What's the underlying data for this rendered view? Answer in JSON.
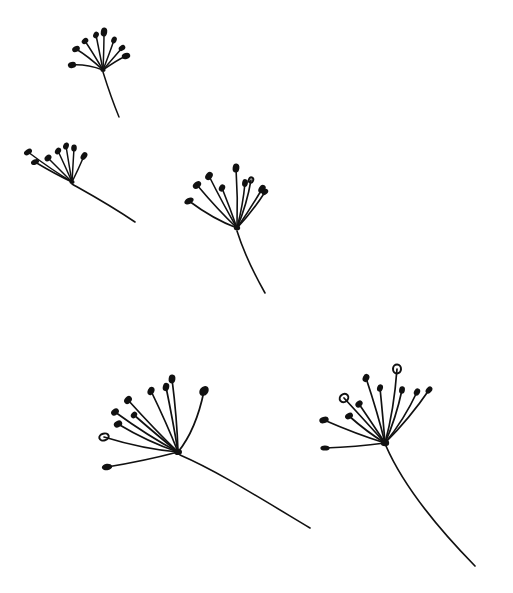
{
  "artwork": {
    "title": "Dandelion Seeds Drifting",
    "medium": "pen-and-ink line drawing",
    "background_color": "#ffffff",
    "ink_color": "#111111",
    "canvas": {
      "width": 513,
      "height": 593
    },
    "subject_count": 5,
    "description": "Five stylized dandelion seed heads (pappus) scattered across a white field, each a radiating fan of fine rays tipped with solid teardrop pods, trailing a single curved stem."
  },
  "seeds": [
    {
      "id": "seed-top-left",
      "label": "Top-left dandelion seed",
      "hub": {
        "x": 103,
        "y": 70
      },
      "hub_radius": 2.6,
      "ray_count": 8,
      "stroke_width": 1.5,
      "rays": [
        {
          "tip": {
            "x": 72,
            "y": 65
          },
          "ctrl": {
            "x": 86,
            "y": 64
          },
          "pod_rx": 4.2,
          "pod_ry": 3.0,
          "pod_rot": -12,
          "ring": false
        },
        {
          "tip": {
            "x": 76,
            "y": 49
          },
          "ctrl": {
            "x": 88,
            "y": 56
          },
          "pod_rx": 4.0,
          "pod_ry": 2.9,
          "pod_rot": -28,
          "ring": false
        },
        {
          "tip": {
            "x": 85,
            "y": 41
          },
          "ctrl": {
            "x": 93,
            "y": 53
          },
          "pod_rx": 3.6,
          "pod_ry": 2.7,
          "pod_rot": -40,
          "ring": false
        },
        {
          "tip": {
            "x": 96,
            "y": 35
          },
          "ctrl": {
            "x": 99,
            "y": 50
          },
          "pod_rx": 3.4,
          "pod_ry": 2.7,
          "pod_rot": -62,
          "ring": false
        },
        {
          "tip": {
            "x": 104,
            "y": 32
          },
          "ctrl": {
            "x": 104,
            "y": 48
          },
          "pod_rx": 4.6,
          "pod_ry": 3.2,
          "pod_rot": -82,
          "ring": false
        },
        {
          "tip": {
            "x": 114,
            "y": 40
          },
          "ctrl": {
            "x": 110,
            "y": 52
          },
          "pod_rx": 3.5,
          "pod_ry": 2.6,
          "pod_rot": -64,
          "ring": false
        },
        {
          "tip": {
            "x": 122,
            "y": 48
          },
          "ctrl": {
            "x": 115,
            "y": 56
          },
          "pod_rx": 3.6,
          "pod_ry": 2.6,
          "pod_rot": -36,
          "ring": false
        },
        {
          "tip": {
            "x": 126,
            "y": 56
          },
          "ctrl": {
            "x": 117,
            "y": 60
          },
          "pod_rx": 4.3,
          "pod_ry": 3.1,
          "pod_rot": -16,
          "ring": false
        }
      ],
      "stem": {
        "d": "M103,72 C108,88 112,100 119,117",
        "width": 1.5
      }
    },
    {
      "id": "seed-middle-left",
      "label": "Middle-left dandelion seed",
      "hub": {
        "x": 72,
        "y": 182
      },
      "hub_radius": 2.6,
      "ray_count": 7,
      "stroke_width": 1.5,
      "rays": [
        {
          "tip": {
            "x": 28,
            "y": 152
          },
          "ctrl": {
            "x": 52,
            "y": 170
          },
          "pod_rx": 4.4,
          "pod_ry": 2.6,
          "pod_rot": -32,
          "ring": false
        },
        {
          "tip": {
            "x": 35,
            "y": 162
          },
          "ctrl": {
            "x": 55,
            "y": 174
          },
          "pod_rx": 4.2,
          "pod_ry": 2.6,
          "pod_rot": -24,
          "ring": false
        },
        {
          "tip": {
            "x": 48,
            "y": 158
          },
          "ctrl": {
            "x": 61,
            "y": 171
          },
          "pod_rx": 3.8,
          "pod_ry": 2.8,
          "pod_rot": -40,
          "ring": false
        },
        {
          "tip": {
            "x": 58,
            "y": 151
          },
          "ctrl": {
            "x": 66,
            "y": 168
          },
          "pod_rx": 3.6,
          "pod_ry": 2.8,
          "pod_rot": -56,
          "ring": false
        },
        {
          "tip": {
            "x": 66,
            "y": 146
          },
          "ctrl": {
            "x": 69,
            "y": 165
          },
          "pod_rx": 3.6,
          "pod_ry": 2.8,
          "pod_rot": -70,
          "ring": false
        },
        {
          "tip": {
            "x": 74,
            "y": 148
          },
          "ctrl": {
            "x": 73,
            "y": 166
          },
          "pod_rx": 3.6,
          "pod_ry": 2.8,
          "pod_rot": -86,
          "ring": false
        },
        {
          "tip": {
            "x": 84,
            "y": 156
          },
          "ctrl": {
            "x": 78,
            "y": 170
          },
          "pod_rx": 4.2,
          "pod_ry": 2.9,
          "pod_rot": -56,
          "ring": false
        }
      ],
      "stem": {
        "d": "M72,184 C88,193 110,205 135,222",
        "width": 1.6
      }
    },
    {
      "id": "seed-center",
      "label": "Center dandelion seed",
      "hub": {
        "x": 237,
        "y": 228
      },
      "hub_radius": 3.2,
      "ray_count": 9,
      "stroke_width": 1.6,
      "rays": [
        {
          "tip": {
            "x": 189,
            "y": 201
          },
          "ctrl": {
            "x": 213,
            "y": 219
          },
          "pod_rx": 5.0,
          "pod_ry": 3.0,
          "pod_rot": -26,
          "ring": false
        },
        {
          "tip": {
            "x": 197,
            "y": 185
          },
          "ctrl": {
            "x": 218,
            "y": 210
          },
          "pod_rx": 4.6,
          "pod_ry": 3.2,
          "pod_rot": -40,
          "ring": false
        },
        {
          "tip": {
            "x": 209,
            "y": 176
          },
          "ctrl": {
            "x": 223,
            "y": 204
          },
          "pod_rx": 4.4,
          "pod_ry": 3.3,
          "pod_rot": -52,
          "ring": false
        },
        {
          "tip": {
            "x": 222,
            "y": 188
          },
          "ctrl": {
            "x": 230,
            "y": 208
          },
          "pod_rx": 3.8,
          "pod_ry": 2.9,
          "pod_rot": -60,
          "ring": false
        },
        {
          "tip": {
            "x": 236,
            "y": 168
          },
          "ctrl": {
            "x": 238,
            "y": 198
          },
          "pod_rx": 4.6,
          "pod_ry": 3.4,
          "pod_rot": -84,
          "ring": false
        },
        {
          "tip": {
            "x": 245,
            "y": 183
          },
          "ctrl": {
            "x": 243,
            "y": 205
          },
          "pod_rx": 3.9,
          "pod_ry": 2.9,
          "pod_rot": -80,
          "ring": false
        },
        {
          "tip": {
            "x": 251,
            "y": 180
          },
          "ctrl": {
            "x": 247,
            "y": 204
          },
          "pod_rx": 2.6,
          "pod_ry": 2.2,
          "pod_rot": -70,
          "ring": true
        },
        {
          "tip": {
            "x": 262,
            "y": 189
          },
          "ctrl": {
            "x": 251,
            "y": 208
          },
          "pod_rx": 4.4,
          "pod_ry": 3.2,
          "pod_rot": -56,
          "ring": false
        },
        {
          "tip": {
            "x": 265,
            "y": 192
          },
          "ctrl": {
            "x": 253,
            "y": 211
          },
          "pod_rx": 3.6,
          "pod_ry": 2.6,
          "pod_rot": -44,
          "ring": false
        }
      ],
      "stem": {
        "d": "M237,231 C243,250 252,270 265,293",
        "width": 1.6
      }
    },
    {
      "id": "seed-bottom-left",
      "label": "Bottom-left dandelion seed with long sweeping stem",
      "hub": {
        "x": 178,
        "y": 452
      },
      "hub_radius": 4.0,
      "ray_count": 10,
      "stroke_width": 1.7,
      "rays": [
        {
          "tip": {
            "x": 107,
            "y": 467
          },
          "ctrl": {
            "x": 144,
            "y": 461
          },
          "pod_rx": 5.2,
          "pod_ry": 3.2,
          "pod_rot": -6,
          "ring": false
        },
        {
          "tip": {
            "x": 104,
            "y": 437
          },
          "ctrl": {
            "x": 143,
            "y": 449
          },
          "pod_rx": 4.8,
          "pod_ry": 3.4,
          "pod_rot": -16,
          "ring": true
        },
        {
          "tip": {
            "x": 118,
            "y": 424
          },
          "ctrl": {
            "x": 148,
            "y": 442
          },
          "pod_rx": 4.4,
          "pod_ry": 3.2,
          "pod_rot": -28,
          "ring": false
        },
        {
          "tip": {
            "x": 115,
            "y": 412
          },
          "ctrl": {
            "x": 148,
            "y": 436
          },
          "pod_rx": 4.2,
          "pod_ry": 3.1,
          "pod_rot": -36,
          "ring": false
        },
        {
          "tip": {
            "x": 128,
            "y": 400
          },
          "ctrl": {
            "x": 155,
            "y": 430
          },
          "pod_rx": 4.4,
          "pod_ry": 3.3,
          "pod_rot": -48,
          "ring": false
        },
        {
          "tip": {
            "x": 134,
            "y": 415
          },
          "ctrl": {
            "x": 158,
            "y": 436
          },
          "pod_rx": 3.6,
          "pod_ry": 2.8,
          "pod_rot": -50,
          "ring": false
        },
        {
          "tip": {
            "x": 151,
            "y": 391
          },
          "ctrl": {
            "x": 167,
            "y": 424
          },
          "pod_rx": 4.3,
          "pod_ry": 3.3,
          "pod_rot": -66,
          "ring": false
        },
        {
          "tip": {
            "x": 166,
            "y": 387
          },
          "ctrl": {
            "x": 173,
            "y": 421
          },
          "pod_rx": 4.2,
          "pod_ry": 3.2,
          "pod_rot": -76,
          "ring": false
        },
        {
          "tip": {
            "x": 172,
            "y": 379
          },
          "ctrl": {
            "x": 177,
            "y": 418
          },
          "pod_rx": 4.4,
          "pod_ry": 3.4,
          "pod_rot": -84,
          "ring": false
        },
        {
          "tip": {
            "x": 204,
            "y": 391
          },
          "ctrl": {
            "x": 196,
            "y": 430
          },
          "pod_rx": 5.4,
          "pod_ry": 4.2,
          "pod_rot": -50,
          "ring": false
        }
      ],
      "stem": {
        "d": "M180,455 C215,470 255,495 310,528",
        "width": 1.6
      }
    },
    {
      "id": "seed-bottom-right",
      "label": "Bottom-right dandelion seed with long curving stem",
      "hub": {
        "x": 385,
        "y": 443
      },
      "hub_radius": 4.2,
      "ray_count": 11,
      "stroke_width": 1.7,
      "rays": [
        {
          "tip": {
            "x": 325,
            "y": 448
          },
          "ctrl": {
            "x": 356,
            "y": 447
          },
          "pod_rx": 4.6,
          "pod_ry": 2.6,
          "pod_rot": 0,
          "ring": false
        },
        {
          "tip": {
            "x": 324,
            "y": 420
          },
          "ctrl": {
            "x": 356,
            "y": 434
          },
          "pod_rx": 4.8,
          "pod_ry": 3.2,
          "pod_rot": -18,
          "ring": false
        },
        {
          "tip": {
            "x": 349,
            "y": 416
          },
          "ctrl": {
            "x": 367,
            "y": 432
          },
          "pod_rx": 4.2,
          "pod_ry": 3.0,
          "pod_rot": -30,
          "ring": false
        },
        {
          "tip": {
            "x": 344,
            "y": 398
          },
          "ctrl": {
            "x": 367,
            "y": 423
          },
          "pod_rx": 4.6,
          "pod_ry": 3.8,
          "pod_rot": -40,
          "ring": true
        },
        {
          "tip": {
            "x": 359,
            "y": 404
          },
          "ctrl": {
            "x": 374,
            "y": 426
          },
          "pod_rx": 4.0,
          "pod_ry": 3.0,
          "pod_rot": -44,
          "ring": false
        },
        {
          "tip": {
            "x": 366,
            "y": 378
          },
          "ctrl": {
            "x": 378,
            "y": 414
          },
          "pod_rx": 4.2,
          "pod_ry": 3.2,
          "pod_rot": -66,
          "ring": false
        },
        {
          "tip": {
            "x": 380,
            "y": 388
          },
          "ctrl": {
            "x": 383,
            "y": 418
          },
          "pod_rx": 3.8,
          "pod_ry": 2.9,
          "pod_rot": -72,
          "ring": false
        },
        {
          "tip": {
            "x": 397,
            "y": 369
          },
          "ctrl": {
            "x": 394,
            "y": 410
          },
          "pod_rx": 4.4,
          "pod_ry": 4.0,
          "pod_rot": -88,
          "ring": true
        },
        {
          "tip": {
            "x": 402,
            "y": 390
          },
          "ctrl": {
            "x": 396,
            "y": 418
          },
          "pod_rx": 3.8,
          "pod_ry": 2.9,
          "pod_rot": -80,
          "ring": false
        },
        {
          "tip": {
            "x": 417,
            "y": 392
          },
          "ctrl": {
            "x": 404,
            "y": 420
          },
          "pod_rx": 3.8,
          "pod_ry": 2.9,
          "pod_rot": -60,
          "ring": false
        },
        {
          "tip": {
            "x": 429,
            "y": 390
          },
          "ctrl": {
            "x": 410,
            "y": 418
          },
          "pod_rx": 4.0,
          "pod_ry": 2.8,
          "pod_rot": -50,
          "ring": false
        }
      ],
      "stem": {
        "d": "M386,446 C400,478 430,520 475,566",
        "width": 1.7
      }
    }
  ]
}
